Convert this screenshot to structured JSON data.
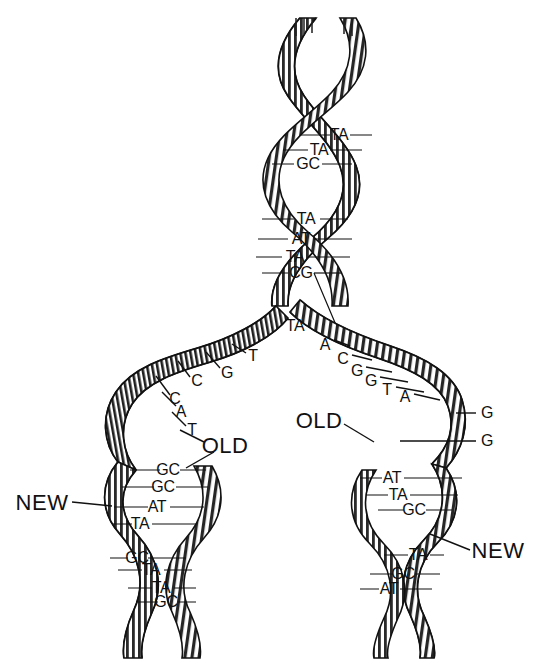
{
  "figure": {
    "line_color": "#1a1a1a",
    "fill_color": "#ffffff",
    "hatch_color": "#2b2b2b",
    "background": "#ffffff"
  },
  "annotations": {
    "old_left": {
      "text": "OLD",
      "x": 225,
      "y": 446
    },
    "old_right": {
      "text": "OLD",
      "x": 319,
      "y": 421
    },
    "new_left": {
      "text": "NEW",
      "x": 42,
      "y": 503
    },
    "new_right": {
      "text": "NEW",
      "x": 498,
      "y": 551
    }
  },
  "parent_helix": {
    "label": "Parent double helix (unreplicated)",
    "base_pairs": [
      {
        "text": "TA",
        "x": 339,
        "y": 135
      },
      {
        "text": "GC",
        "x": 308,
        "y": 164
      },
      {
        "text": "TA",
        "x": 306,
        "y": 219
      },
      {
        "text": "AT",
        "x": 301,
        "y": 239
      },
      {
        "text": "TA",
        "x": 295,
        "y": 257
      },
      {
        "text": "CG",
        "x": 301,
        "y": 273
      },
      {
        "text": "TA",
        "x": 319,
        "y": 150
      },
      {
        "text": "TA",
        "x": 295,
        "y": 326
      }
    ]
  },
  "left_template_strand": {
    "label": "OLD left template strand unpaired bases",
    "bases": [
      {
        "text": "T",
        "x": 253,
        "y": 356
      },
      {
        "text": "G",
        "x": 227,
        "y": 373
      },
      {
        "text": "C",
        "x": 197,
        "y": 381
      },
      {
        "text": "C",
        "x": 175,
        "y": 399
      },
      {
        "text": "A",
        "x": 181,
        "y": 412
      },
      {
        "text": "T",
        "x": 192,
        "y": 430
      }
    ]
  },
  "right_template_strand": {
    "label": "OLD right template strand unpaired bases",
    "bases": [
      {
        "text": "A",
        "x": 325,
        "y": 345
      },
      {
        "text": "C",
        "x": 343,
        "y": 359
      },
      {
        "text": "G",
        "x": 357,
        "y": 371
      },
      {
        "text": "G",
        "x": 371,
        "y": 381
      },
      {
        "text": "T",
        "x": 387,
        "y": 390
      },
      {
        "text": "A",
        "x": 405,
        "y": 397
      },
      {
        "text": "G",
        "x": 487,
        "y": 413
      },
      {
        "text": "G",
        "x": 487,
        "y": 441
      }
    ]
  },
  "left_daughter_helix": {
    "label": "Left daughter duplex (NEW strand paired with OLD)",
    "base_pairs": [
      {
        "text": "GC",
        "x": 168,
        "y": 470
      },
      {
        "text": "GC",
        "x": 163,
        "y": 487
      },
      {
        "text": "AT",
        "x": 157,
        "y": 507
      },
      {
        "text": "TA",
        "x": 140,
        "y": 524
      },
      {
        "text": "GC",
        "x": 137,
        "y": 558
      },
      {
        "text": "TA",
        "x": 151,
        "y": 570
      },
      {
        "text": "TA",
        "x": 161,
        "y": 588
      },
      {
        "text": "GC",
        "x": 166,
        "y": 602
      }
    ]
  },
  "right_daughter_helix": {
    "label": "Right daughter duplex (NEW strand paired with OLD)",
    "base_pairs": [
      {
        "text": "AT",
        "x": 392,
        "y": 478
      },
      {
        "text": "TA",
        "x": 398,
        "y": 495
      },
      {
        "text": "GC",
        "x": 414,
        "y": 510
      },
      {
        "text": "TA",
        "x": 418,
        "y": 555
      },
      {
        "text": "GC",
        "x": 403,
        "y": 574
      },
      {
        "text": "AT",
        "x": 389,
        "y": 589
      }
    ]
  }
}
